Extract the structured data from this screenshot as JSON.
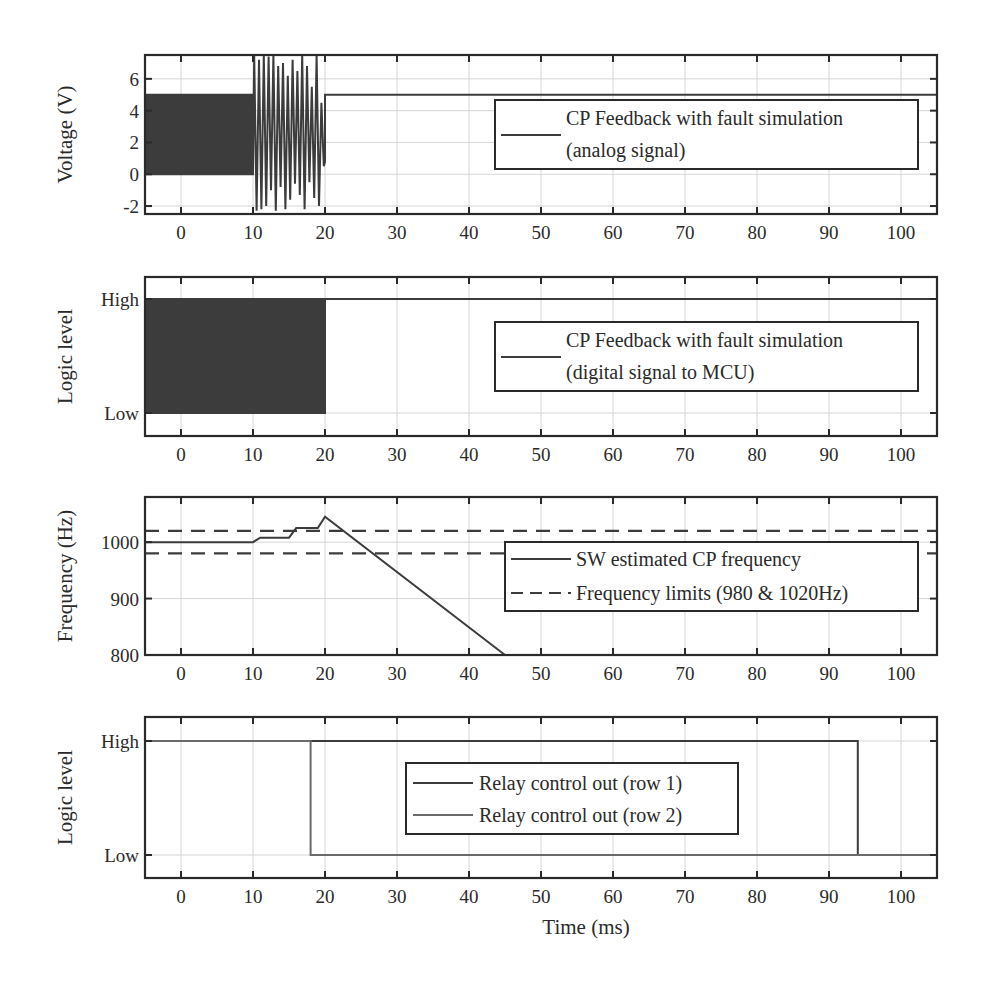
{
  "figure": {
    "xlabel": "Time (ms)",
    "x_ticks": [
      0,
      10,
      20,
      30,
      40,
      50,
      60,
      70,
      80,
      90,
      100
    ],
    "xlim": [
      -5,
      105
    ]
  },
  "chart_data": [
    {
      "type": "line",
      "title": "",
      "xlabel": "",
      "ylabel": "Voltage (V)",
      "xlim": [
        -5,
        105
      ],
      "ylim": [
        -2.5,
        7.5
      ],
      "y_ticks": [
        -2,
        0,
        2,
        4,
        6
      ],
      "y_tick_labels": [
        "-2",
        "0",
        "2",
        "4",
        "6"
      ],
      "grid": true,
      "legend": {
        "position": "inside-right",
        "entries": [
          "CP Feedback with fault simulation",
          "(analog signal)"
        ]
      },
      "series": [
        {
          "name": "CP Feedback with fault simulation (analog signal)",
          "description": "1 kHz square wave 0-5 V from -5 to 10 ms; noisy oscillation between about -2.3 V and 7.5 V from 10 to 20 ms; constant 5 V from 20 ms onward",
          "segments": [
            {
              "x_range": [
                -5,
                10
              ],
              "form": "square",
              "low": 0,
              "high": 5,
              "period_ms": 0.5
            },
            {
              "x_range": [
                10,
                20
              ],
              "form": "fault-oscillation",
              "min": -2.3,
              "max": 7.5
            },
            {
              "x_range": [
                20,
                105
              ],
              "form": "constant",
              "value": 5
            }
          ]
        }
      ]
    },
    {
      "type": "line",
      "title": "",
      "xlabel": "",
      "ylabel": "Logic level",
      "xlim": [
        -5,
        105
      ],
      "ylim": [
        "Low",
        "High"
      ],
      "y_tick_labels": [
        "High",
        "Low"
      ],
      "grid": true,
      "legend": {
        "position": "inside-right",
        "entries": [
          "CP Feedback with fault simulation",
          "(digital signal to MCU)"
        ]
      },
      "series": [
        {
          "name": "CP Feedback with fault simulation (digital signal to MCU)",
          "description": "Digital square wave toggling between Low and High from -5 to 20 ms; held High from 20 ms onward",
          "segments": [
            {
              "x_range": [
                -5,
                20
              ],
              "form": "square",
              "low": "Low",
              "high": "High",
              "period_ms": 0.5
            },
            {
              "x_range": [
                20,
                105
              ],
              "form": "constant",
              "value": "High"
            }
          ]
        }
      ]
    },
    {
      "type": "line",
      "title": "",
      "xlabel": "",
      "ylabel": "Frequency (Hz)",
      "xlim": [
        -5,
        105
      ],
      "ylim": [
        800,
        1080
      ],
      "y_ticks": [
        800,
        900,
        1000
      ],
      "y_tick_labels": [
        "800",
        "900",
        "1000"
      ],
      "grid": true,
      "legend": {
        "position": "inside-right",
        "entries": [
          "SW estimated CP frequency",
          "Frequency limits (980 & 1020Hz)"
        ]
      },
      "series": [
        {
          "name": "SW estimated CP frequency",
          "style": "solid",
          "x": [
            -5,
            10,
            11,
            15,
            16,
            19,
            20,
            45
          ],
          "y": [
            1000,
            1000,
            1008,
            1008,
            1025,
            1025,
            1045,
            800
          ]
        },
        {
          "name": "Frequency limits (980 & 1020Hz)",
          "style": "dashed",
          "lines": [
            980,
            1020
          ]
        }
      ]
    },
    {
      "type": "line",
      "title": "",
      "xlabel": "Time (ms)",
      "ylabel": "Logic level",
      "xlim": [
        -5,
        105
      ],
      "ylim": [
        "Low",
        "High"
      ],
      "y_tick_labels": [
        "High",
        "Low"
      ],
      "grid": true,
      "legend": {
        "position": "inside-center",
        "entries": [
          "Relay control out (row 1)",
          "Relay control out (row 2)"
        ]
      },
      "series": [
        {
          "name": "Relay control out (row 1)",
          "x": [
            -5,
            94,
            94,
            105
          ],
          "y": [
            "High",
            "High",
            "Low",
            "Low"
          ]
        },
        {
          "name": "Relay control out (row 2)",
          "x": [
            -5,
            18,
            18,
            105
          ],
          "y": [
            "High",
            "High",
            "Low",
            "Low"
          ]
        }
      ]
    }
  ],
  "colors": {
    "line": "#3c3c3c",
    "line_light": "#6a6a6a",
    "axis": "#2a2a2a",
    "grid": "#d6d6d6",
    "background": "#ffffff"
  }
}
